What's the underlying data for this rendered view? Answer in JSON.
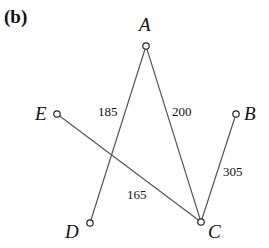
{
  "panel_label": "(b)",
  "nodes": {
    "A": {
      "label": "A",
      "x": 146,
      "y": 46
    },
    "B": {
      "label": "B",
      "x": 236,
      "y": 114
    },
    "C": {
      "label": "C",
      "x": 201,
      "y": 222
    },
    "D": {
      "label": "D",
      "x": 90,
      "y": 223
    },
    "E": {
      "label": "E",
      "x": 57,
      "y": 114
    }
  },
  "edges": [
    {
      "from": "A",
      "to": "D",
      "weight": "185"
    },
    {
      "from": "A",
      "to": "C",
      "weight": "200"
    },
    {
      "from": "E",
      "to": "C",
      "weight": "165"
    },
    {
      "from": "B",
      "to": "C",
      "weight": "305"
    }
  ],
  "colors": {
    "edge": "#555555",
    "node_stroke": "#222222",
    "text": "#111111"
  }
}
